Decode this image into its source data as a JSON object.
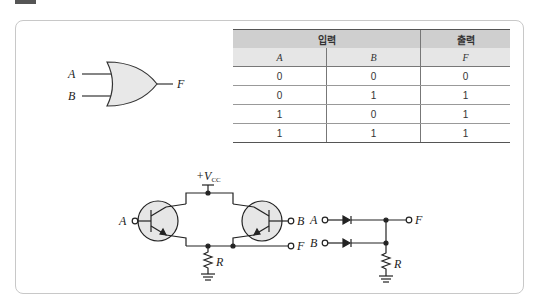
{
  "or_gate": {
    "inputs": [
      "A",
      "B"
    ],
    "output": "F"
  },
  "truth_table": {
    "group_headers": {
      "input": "입력",
      "output": "출력"
    },
    "columns": [
      "A",
      "B",
      "F"
    ],
    "rows": [
      [
        "0",
        "0",
        "0"
      ],
      [
        "0",
        "1",
        "1"
      ],
      [
        "1",
        "0",
        "1"
      ],
      [
        "1",
        "1",
        "1"
      ]
    ]
  },
  "transistor_circuit": {
    "supply_label": "+V",
    "supply_sub": "CC",
    "input_a": "A",
    "input_b": "B",
    "output": "F",
    "resistor": "R"
  },
  "diode_circuit": {
    "input_a": "A",
    "input_b": "B",
    "output": "F",
    "resistor": "R"
  },
  "colors": {
    "gate_fill": "#e8e8e8",
    "header_dark": "#cfcfcf",
    "header_light": "#e6e6e6",
    "frame_border": "#c8c8c8"
  }
}
